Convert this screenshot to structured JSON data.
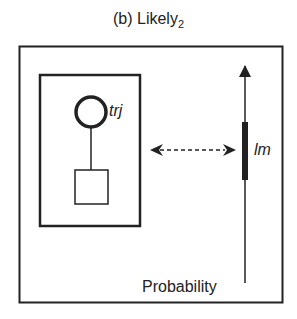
{
  "title": {
    "text": "(b) Likely",
    "subscript": "2"
  },
  "nodes": {
    "latent": {
      "label": "trj",
      "shape": "circle"
    },
    "observed": {
      "label": "",
      "shape": "square"
    }
  },
  "axis": {
    "label": "Probability",
    "highlight_label": "lm"
  },
  "colors": {
    "stroke": "#222222",
    "background": "#ffffff"
  }
}
